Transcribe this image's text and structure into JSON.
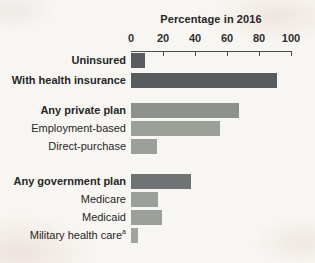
{
  "chart_data": {
    "type": "bar",
    "orientation": "horizontal",
    "title": "Percentage in 2016",
    "xlabel": "",
    "ylabel": "",
    "xlim": [
      0,
      100
    ],
    "x_ticks": [
      0,
      20,
      40,
      60,
      80,
      100
    ],
    "grid": false,
    "legend": false,
    "axis_color": "#4d4d4d",
    "text_color": "#262626",
    "background_color": "#f8f6f2",
    "rows": [
      {
        "label": "Uninsured",
        "value": 8.8,
        "bold": true,
        "color": "#595c5e",
        "gap": "none"
      },
      {
        "label": "With health insurance",
        "value": 91.2,
        "bold": true,
        "color": "#595c5e",
        "gap": "sm"
      },
      {
        "label": "Any private plan",
        "value": 67.5,
        "bold": true,
        "color": "#8d928c",
        "gap": "md"
      },
      {
        "label": "Employment-based",
        "value": 55.7,
        "bold": false,
        "color": "#9ba098",
        "gap": "xs"
      },
      {
        "label": "Direct-purchase",
        "value": 16.2,
        "bold": false,
        "color": "#9ba098",
        "gap": "xs"
      },
      {
        "label": "Any government plan",
        "value": 37.3,
        "bold": true,
        "color": "#6f7374",
        "gap": "lg"
      },
      {
        "label": "Medicare",
        "value": 16.7,
        "bold": false,
        "color": "#9ba098",
        "gap": "xs"
      },
      {
        "label": "Medicaid",
        "value": 19.4,
        "bold": false,
        "color": "#9ba098",
        "gap": "xs"
      },
      {
        "label": "Military health care",
        "sup": "a",
        "value": 4.6,
        "bold": false,
        "color": "#9fa49d",
        "gap": "xs"
      }
    ]
  }
}
